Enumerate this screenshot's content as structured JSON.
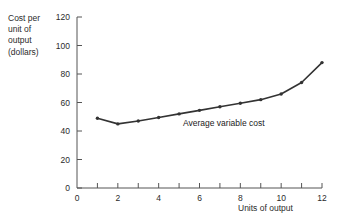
{
  "chart_data": {
    "type": "line",
    "title": "",
    "xlabel": "Units of output",
    "ylabel": "Cost per unit of output (dollars)",
    "ylabel_lines": [
      "Cost per",
      "unit of",
      "output",
      "(dollars)"
    ],
    "x": [
      1,
      2,
      3,
      4,
      5,
      6,
      7,
      8,
      9,
      10,
      11,
      12
    ],
    "values": [
      49,
      45,
      47,
      49.5,
      52,
      54.5,
      57,
      59.5,
      62,
      66,
      74,
      88
    ],
    "series": [
      {
        "name": "Average variable cost",
        "values": [
          49,
          45,
          47,
          49.5,
          52,
          54.5,
          57,
          59.5,
          62,
          66,
          74,
          88
        ]
      }
    ],
    "annotations": [
      {
        "text": "Average variable cost",
        "x": 6.5,
        "y": 50
      }
    ],
    "xlim": [
      0,
      12
    ],
    "ylim": [
      0,
      120
    ],
    "xticks": [
      0,
      1,
      2,
      3,
      4,
      5,
      6,
      7,
      8,
      9,
      10,
      11,
      12
    ],
    "xtick_labels": [
      "0",
      "",
      "2",
      "",
      "4",
      "",
      "6",
      "",
      "8",
      "",
      "10",
      "",
      "12"
    ],
    "yticks": [
      0,
      20,
      40,
      60,
      80,
      100,
      120
    ],
    "ytick_labels": [
      "0",
      "20",
      "40",
      "60",
      "80",
      "100",
      "120"
    ],
    "grid": false,
    "legend": "none",
    "line_color": "#333333",
    "marker": "dot",
    "axis_color": "#555555"
  }
}
